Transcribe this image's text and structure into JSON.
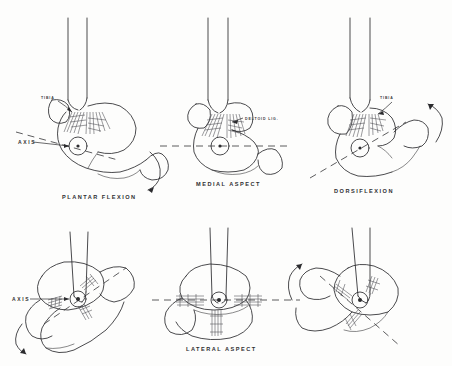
{
  "figure": {
    "background_color": "#fdfdfc",
    "ink_color": "#2b2b2e",
    "rows": 2,
    "columns": 3
  },
  "panels": [
    {
      "id": "top-left",
      "position": "row1-col1",
      "caption": "PLANTAR FLEXION",
      "axis_label": "AXIS",
      "bone_label": "TIBIA",
      "view": "medial",
      "motion": "plantar flexion",
      "rotation_arrow": "downward",
      "has_axis_marker": true,
      "has_axis_dashline": true,
      "has_ligament_hatching": true
    },
    {
      "id": "top-center",
      "position": "row1-col2",
      "caption": "MEDIAL ASPECT",
      "axis_label": "",
      "bone_label": "DELTOID LIG.",
      "view": "medial",
      "motion": "neutral",
      "rotation_arrow": "none",
      "has_axis_marker": true,
      "has_axis_dashline": true,
      "has_ligament_hatching": true
    },
    {
      "id": "top-right",
      "position": "row1-col3",
      "caption": "DORSIFLEXION",
      "axis_label": "",
      "bone_label": "TIBIA",
      "view": "medial",
      "motion": "dorsiflexion",
      "rotation_arrow": "upward",
      "has_axis_marker": true,
      "has_axis_dashline": true,
      "has_ligament_hatching": true
    },
    {
      "id": "bottom-left",
      "position": "row2-col1",
      "caption": "",
      "axis_label": "AXIS",
      "bone_label": "",
      "view": "lateral",
      "motion": "plantar flexion",
      "rotation_arrow": "downward",
      "has_axis_marker": true,
      "has_axis_dashline": true,
      "has_ligament_hatching": true
    },
    {
      "id": "bottom-center",
      "position": "row2-col2",
      "caption": "LATERAL ASPECT",
      "axis_label": "",
      "bone_label": "",
      "view": "lateral",
      "motion": "neutral",
      "rotation_arrow": "none",
      "has_axis_marker": true,
      "has_axis_dashline": true,
      "has_ligament_hatching": true
    },
    {
      "id": "bottom-right",
      "position": "row2-col3",
      "caption": "",
      "axis_label": "",
      "bone_label": "",
      "view": "lateral",
      "motion": "dorsiflexion",
      "rotation_arrow": "upward",
      "has_axis_marker": true,
      "has_axis_dashline": true,
      "has_ligament_hatching": true
    }
  ],
  "labels": {
    "axis_top": "AXIS",
    "axis_bottom": "AXIS",
    "deltoid": "DELTOID LIG.",
    "tibia_left": "TIBIA",
    "tibia_right": "TIBIA",
    "plantar_flexion": "PLANTAR FLEXION",
    "medial_aspect": "MEDIAL ASPECT",
    "dorsiflexion": "DORSIFLEXION",
    "lateral_aspect": "LATERAL ASPECT"
  }
}
